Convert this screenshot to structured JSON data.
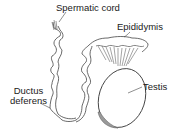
{
  "diagram": {
    "title": "",
    "labels": {
      "spermatic_cord": "Spermatic cord",
      "epididymis": "Epididymis",
      "testis": "Testis",
      "ductus_line1": "Ductus",
      "ductus_line2": "deferens"
    },
    "colors": {
      "stroke": "#444444",
      "text": "#1a1a1a",
      "shade": "#9a9a9a",
      "background": "#ffffff"
    }
  }
}
